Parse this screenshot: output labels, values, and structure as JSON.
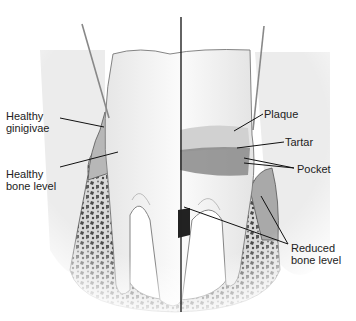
{
  "figure": {
    "colors": {
      "tooth": "#f4f4f4",
      "gum": "#e2e2e2",
      "bone": "#d8d8d8",
      "bone_spots": "#555555",
      "plaque": "#cfcfcf",
      "tartar": "#7a7a7a",
      "leader": "#111111"
    }
  },
  "labels": {
    "healthy_gingivae": {
      "line1": "Healthy",
      "line2": "ginigivae"
    },
    "healthy_bone_level": {
      "line1": "Healthy",
      "line2": "bone level"
    },
    "plaque": {
      "line1": "Plaque"
    },
    "tartar": {
      "line1": "Tartar"
    },
    "pocket": {
      "line1": "Pocket"
    },
    "reduced_bone_level": {
      "line1": "Reduced",
      "line2": "bone level"
    }
  }
}
